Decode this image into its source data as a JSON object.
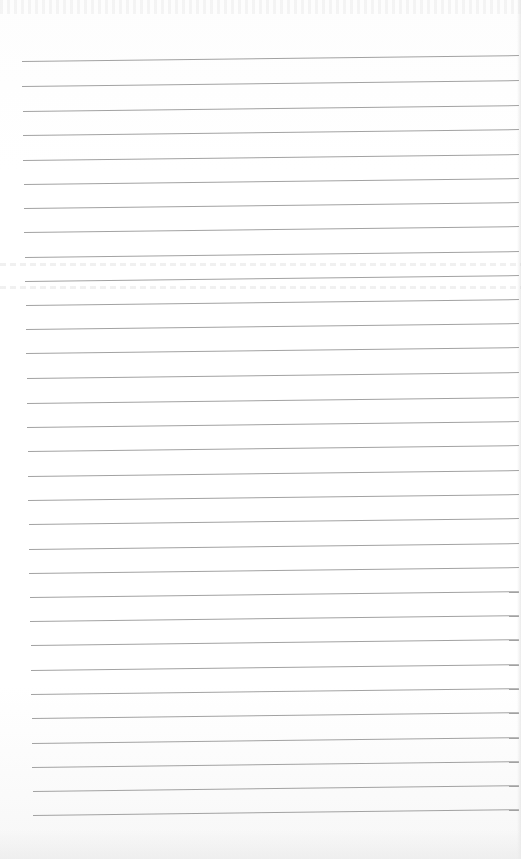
{
  "page": {
    "type": "lined-paper",
    "background_color": "#ffffff",
    "rule_color": "#a2a2a2",
    "rule_count": 32,
    "rule_left_top": 22,
    "rule_left_bottom": 33,
    "rule_right": 519,
    "rule_tilt_px": -6,
    "rules_y": [
      61,
      86,
      111,
      135,
      160,
      184,
      208,
      232,
      257,
      281,
      305,
      329,
      353,
      378,
      403,
      427,
      451,
      476,
      500,
      524,
      549,
      573,
      597,
      621,
      645,
      670,
      694,
      718,
      743,
      767,
      791,
      815
    ],
    "bleed_through_rows_y": [
      263,
      286
    ]
  }
}
